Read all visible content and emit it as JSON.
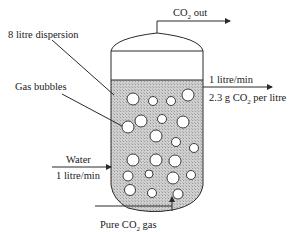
{
  "diagram": {
    "labels": {
      "dispersion": "8 litre dispersion",
      "gas_bubbles": "Gas bubbles",
      "co2_out_main": "CO",
      "co2_out_sub": "2",
      "co2_out_tail": " out",
      "outlet_flow": "1 litre/min",
      "outlet_conc_head": "2.3 g CO",
      "outlet_conc_sub": "2",
      "outlet_conc_tail": " per litre",
      "water_inlet": "Water",
      "water_flow": "1 litre/min",
      "gas_inlet_head": "Pure CO",
      "gas_inlet_sub": "2",
      "gas_inlet_tail": " gas"
    },
    "colors": {
      "line": "#2a2a2a",
      "liquid_fill": "#c8c8c8",
      "bubble_fill": "#ffffff",
      "text": "#1a1a1a"
    }
  }
}
